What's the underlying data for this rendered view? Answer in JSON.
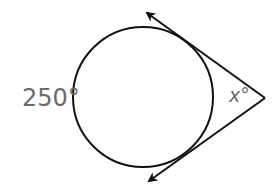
{
  "diagram": {
    "type": "circle-with-two-tangents",
    "arc_label": "250°",
    "angle_label": {
      "variable": "x",
      "degree_symbol": "°"
    },
    "colors": {
      "stroke": "#111111",
      "label": "#6b6b6b",
      "background": "#ffffff"
    }
  }
}
